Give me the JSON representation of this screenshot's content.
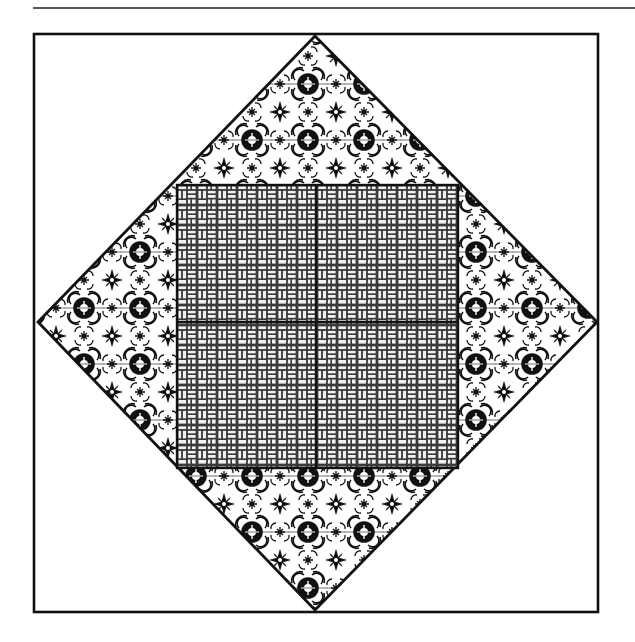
{
  "diagram": {
    "type": "quilt-block",
    "colors": {
      "background": "#ffffff",
      "ink": "#111111",
      "brick_fill": "#f2f2f2",
      "brick_line": "#3a3a3a",
      "lace_fill": "#ffffff"
    },
    "top_rule": {
      "x1": 33,
      "y1": 8,
      "x2": 635,
      "y2": 8
    },
    "outer_frame": {
      "x": 34,
      "y": 34,
      "width": 564,
      "height": 578
    },
    "diamond": {
      "pattern": "floral-lace",
      "points": {
        "top": [
          315,
          36
        ],
        "left": [
          38,
          322
        ],
        "right": [
          597,
          322
        ],
        "bottom": [
          315,
          610
        ]
      }
    },
    "center_square": {
      "pattern": "herringbone-brick",
      "x": 177,
      "y": 185,
      "width": 281,
      "height": 283,
      "divider_x": 316,
      "divider_y": 322,
      "patches": [
        {
          "name": "top-left"
        },
        {
          "name": "top-right"
        },
        {
          "name": "bottom-left"
        },
        {
          "name": "bottom-right"
        }
      ]
    }
  }
}
